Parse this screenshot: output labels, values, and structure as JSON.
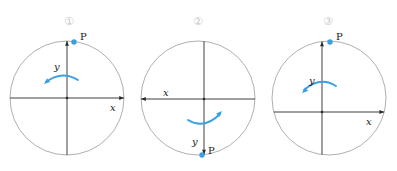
{
  "figure": {
    "width": 397,
    "height": 171,
    "background": "#ffffff",
    "colors": {
      "circle_stroke": "#9a9a9a",
      "axis_stroke": "#2b2b2b",
      "accent_blue": "#3aa0e0",
      "point_blue": "#3aa0e0",
      "label_text": "#1b1b1b",
      "number_gray": "#c8c8c8"
    }
  },
  "panels": [
    {
      "id": "panel-1",
      "number_label": "①",
      "number_x": 70,
      "number_y": 16,
      "circle": {
        "cx": 67,
        "cy": 98,
        "r": 57
      },
      "origin": {
        "x": 67,
        "y": 98
      },
      "axes": {
        "x": {
          "label": "x",
          "direction": "right",
          "label_x": 110,
          "label_y": 103
        },
        "y": {
          "label": "y",
          "direction": "up",
          "label_x": 54,
          "label_y": 62
        }
      },
      "point": {
        "label": "P",
        "x": 74,
        "y": 42,
        "label_x": 80,
        "label_y": 32
      },
      "rotation_arrow": {
        "direction": "counterclockwise",
        "path": "M 78 80 Q 62 70 46 82",
        "head_x": 44,
        "head_y": 84,
        "head_angle": 140
      }
    },
    {
      "id": "panel-2",
      "number_label": "②",
      "number_x": 199,
      "number_y": 16,
      "circle": {
        "cx": 198,
        "cy": 98,
        "r": 57
      },
      "origin": {
        "x": 204,
        "y": 99
      },
      "axes": {
        "x": {
          "label": "x",
          "direction": "left",
          "label_x": 163,
          "label_y": 88
        },
        "y": {
          "label": "y",
          "direction": "down",
          "label_x": 192,
          "label_y": 137
        }
      },
      "point": {
        "label": "P",
        "x": 202,
        "y": 155,
        "label_x": 208,
        "label_y": 146
      },
      "rotation_arrow": {
        "direction": "clockwise",
        "path": "M 188 120 Q 204 130 220 114",
        "head_x": 222,
        "head_y": 111,
        "head_angle": -45
      }
    },
    {
      "id": "panel-3",
      "number_label": "③",
      "number_x": 329,
      "number_y": 16,
      "circle": {
        "cx": 329,
        "cy": 98,
        "r": 57
      },
      "origin": {
        "x": 322,
        "y": 112
      },
      "axes": {
        "x": {
          "label": "x",
          "direction": "right",
          "label_x": 366,
          "label_y": 117
        },
        "y": {
          "label": "y",
          "direction": "up",
          "label_x": 309,
          "label_y": 76
        }
      },
      "point": {
        "label": "P",
        "x": 330,
        "y": 42,
        "label_x": 336,
        "label_y": 32
      },
      "rotation_arrow": {
        "direction": "counterclockwise",
        "path": "M 336 86 Q 320 76 304 90",
        "head_x": 302,
        "head_y": 93,
        "head_angle": 140
      }
    }
  ]
}
